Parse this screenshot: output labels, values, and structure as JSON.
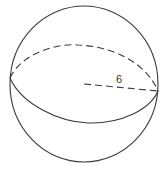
{
  "figure": {
    "type": "sphere",
    "radius_label": "6",
    "colors": {
      "stroke": "#3a3a3a",
      "background": "#ffffff"
    }
  }
}
